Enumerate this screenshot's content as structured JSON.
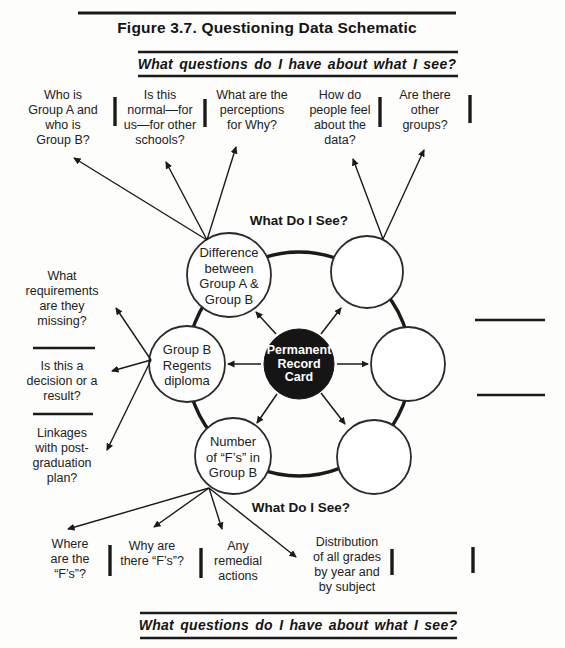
{
  "page": {
    "title": "Figure 3.7. Questioning Data Schematic",
    "top_banner": "What questions do I have about what I see?",
    "bottom_banner": "What questions do I have about what I see?"
  },
  "diagram": {
    "what_do_i_see_top": "What Do I See?",
    "what_do_i_see_bottom": "What Do I See?",
    "center_label": "Permanent\nRecord\nCard",
    "circle_labels": {
      "difference": "Difference\nbetween\nGroup A &\nGroup B",
      "regents": "Group B\nRegents\ndiploma",
      "number_fs": "Number\nof “F’s” in\nGroup B"
    }
  },
  "questions": {
    "top": [
      "Who is\nGroup A and\nwho is\nGroup B?",
      "Is this\nnormal—for\nus—for other\nschools?",
      "What are the\nperceptions\nfor Why?",
      "How do\npeople feel\nabout the\ndata?",
      "Are there\nother\ngroups?"
    ],
    "left": [
      "What\nrequirements\nare they\nmissing?",
      "Is this a\ndecision or a\nresult?",
      "Linkages\nwith post-\ngraduation\nplan?"
    ],
    "bottom": [
      "Where\nare the\n“F’s”?",
      "Why are\nthere “F’s”?",
      "Any\nremedial\nactions",
      "Distribution\nof all grades\nby year and\nby subject"
    ]
  },
  "colors": {
    "ink": "#1a1a1a",
    "center_fill": "#151515",
    "circle_fill": "#ffffff"
  }
}
